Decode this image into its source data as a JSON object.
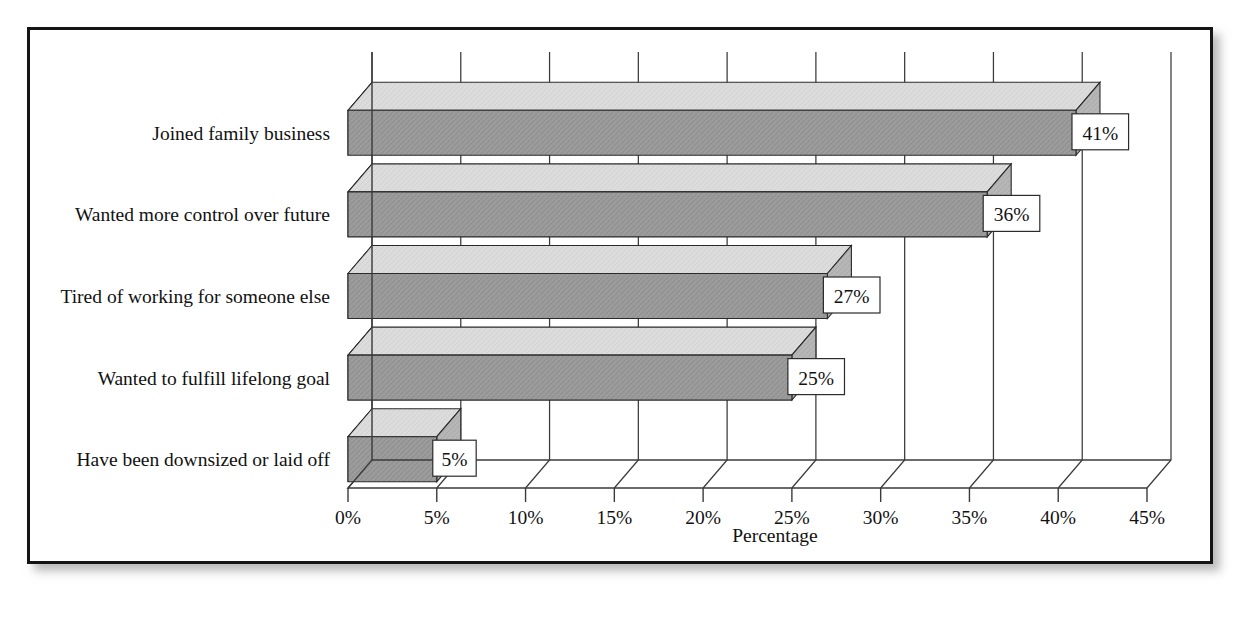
{
  "chart_data": {
    "type": "bar",
    "orientation": "horizontal",
    "style": "3d",
    "title": "",
    "xlabel": "Percentage",
    "ylabel": "",
    "categories": [
      "Joined family business",
      "Wanted more control over future",
      "Tired of working for someone else",
      "Wanted to fulfill lifelong goal",
      "Have been downsized or laid off"
    ],
    "values": [
      41,
      36,
      27,
      25,
      5
    ],
    "data_labels": [
      "41%",
      "36%",
      "27%",
      "25%",
      "5%"
    ],
    "xlim": [
      0,
      45
    ],
    "xticks": [
      0,
      5,
      10,
      15,
      20,
      25,
      30,
      35,
      40,
      45
    ],
    "xtick_labels": [
      "0%",
      "5%",
      "10%",
      "15%",
      "20%",
      "25%",
      "30%",
      "35%",
      "40%",
      "45%"
    ],
    "grid": true,
    "legend": null,
    "colors": {
      "bar_front": "#9c9c9c",
      "bar_top": "#dcdcdc",
      "bar_side": "#b4b4b4",
      "bar_cap_dark": "#0d0d0d",
      "outline": "#2a2a2a",
      "axis": "#3a3a3a",
      "text": "#111111",
      "frame": "#141414",
      "background": "#ffffff",
      "label_box": "#ffffff"
    }
  },
  "page": {
    "top_fragment": ""
  }
}
